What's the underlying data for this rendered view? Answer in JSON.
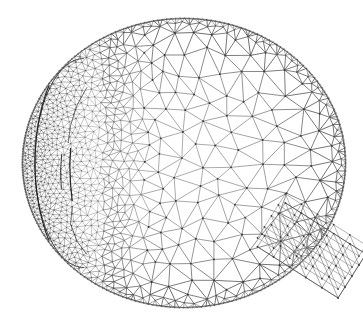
{
  "figure": {
    "title": "Triangular finite element surface mesh of a human eye globe",
    "render_style": "wireframe",
    "background_color": "#ffffff",
    "width": 363,
    "height": 326
  },
  "chart_data": {
    "type": "diagram",
    "title": "Triangular finite element surface mesh of a human eye globe",
    "subtitle": "",
    "xlabel": "",
    "ylabel": "",
    "grid": false,
    "legend_position": "none",
    "annotations": [],
    "colors": {
      "background": "#ffffff",
      "edge_coarse": "#8a8a8a",
      "edge_medium": "#7c7c7c",
      "edge_fine": "#6e6e6e",
      "node": "#3a3a3a",
      "crease": "#1e1e1e",
      "silhouette": "#4a4a4a"
    },
    "line_widths": {
      "coarse": 0.75,
      "medium": 0.6,
      "fine": 0.38,
      "crease": 1.15,
      "silhouette": 0.9
    },
    "globe": {
      "center_x": 184,
      "center_y": 163,
      "radius_x": 162,
      "radius_y": 145,
      "top_y": 18,
      "bottom_y": 308,
      "left_x": 22,
      "right_x": 346
    },
    "regions": [
      {
        "name": "sclera-posterior-coarse",
        "description": "Coarse irregular Delaunay triangulation over the posterior scleral shell occupying the right two thirds of the globe",
        "mesh_density": "coarse",
        "target_edge_length_px": 19,
        "approx_nodes": 430,
        "approx_triangles": 790
      },
      {
        "name": "sclera-rim-band",
        "description": "Finer structured band of triangles following the outer silhouette of the globe",
        "mesh_density": "medium",
        "target_edge_length_px": 11,
        "approx_nodes": 260,
        "approx_triangles": 470
      },
      {
        "name": "limbus-transition",
        "description": "Graded transition zone where element size shrinks from scleral coarse to corneal fine",
        "mesh_density": "graded",
        "target_edge_length_px": 7,
        "approx_nodes": 520,
        "approx_triangles": 960
      },
      {
        "name": "cornea-anterior-fine",
        "description": "Very dense triangulation over the anterior corneal dome on the left of the view",
        "mesh_density": "fine",
        "target_edge_length_px": 3,
        "approx_nodes": 3100,
        "approx_triangles": 5900
      },
      {
        "name": "optic-nerve-stub",
        "description": "Slanted rectangular optic nerve stub protruding from the lower right of the globe, structured diagonal triangulation",
        "mesh_density": "coarse",
        "target_edge_length_px": 13,
        "approx_nodes": 120,
        "approx_triangles": 180
      }
    ],
    "creases": [
      {
        "name": "limbus-outer-crease",
        "description": "Dark fold line marking the outer corneal limbus"
      },
      {
        "name": "limbus-inner-crease",
        "description": "Dark fold line marking the inner corneal ring"
      },
      {
        "name": "iris-slit-crease",
        "description": "Short vertical dark slit near the corneal apex"
      }
    ],
    "optic_nerve": {
      "attach_x": 300,
      "attach_y": 243,
      "tip_x": 352,
      "tip_y": 276,
      "half_width_px": 26,
      "angle_deg": 32
    }
  }
}
